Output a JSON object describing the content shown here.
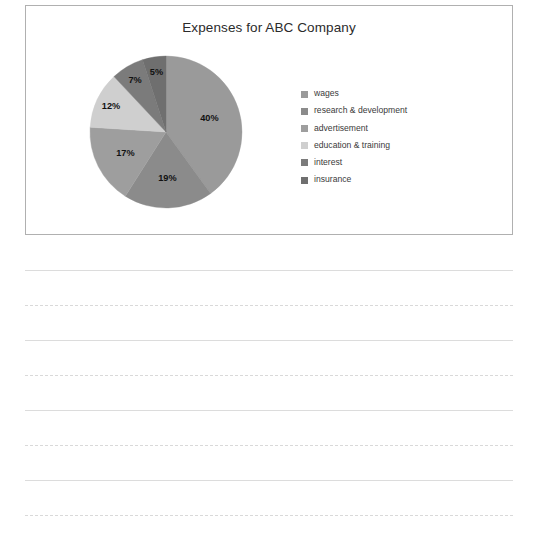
{
  "chart_panel": {
    "title": "Expenses for ABC Company",
    "border_color": "#b0b0b0",
    "background": "#ffffff"
  },
  "chart_data": {
    "type": "pie",
    "title": "Expenses for ABC Company",
    "xlabel": "",
    "ylabel": "",
    "legend_position": "right",
    "grid": false,
    "start_angle_deg": 0,
    "direction": "clockwise",
    "unit": "%",
    "categories": [
      "wages",
      "research & development",
      "advertisement",
      "education & training",
      "interest",
      "insurance"
    ],
    "values": [
      40,
      19,
      17,
      12,
      7,
      5
    ],
    "labels": [
      "40%",
      "19%",
      "17%",
      "12%",
      "7%",
      "5%"
    ],
    "colors": [
      "#9a9a9a",
      "#8b8b8b",
      "#9e9e9e",
      "#cfcfcf",
      "#7b7b7b",
      "#6f6f6f"
    ],
    "slices": [
      {
        "name": "wages",
        "value": 40,
        "label": "40%",
        "color": "#9a9a9a"
      },
      {
        "name": "research & development",
        "value": 19,
        "label": "19%",
        "color": "#8b8b8b"
      },
      {
        "name": "advertisement",
        "value": 17,
        "label": "17%",
        "color": "#9e9e9e"
      },
      {
        "name": "education & training",
        "value": 12,
        "label": "12%",
        "color": "#cfcfcf"
      },
      {
        "name": "interest",
        "value": 7,
        "label": "7%",
        "color": "#7b7b7b"
      },
      {
        "name": "insurance",
        "value": 5,
        "label": "5%",
        "color": "#6f6f6f"
      }
    ]
  },
  "legend": {
    "items": [
      {
        "label": "wages",
        "color": "#9a9a9a"
      },
      {
        "label": "research & development",
        "color": "#8b8b8b"
      },
      {
        "label": "advertisement",
        "color": "#9e9e9e"
      },
      {
        "label": "education & training",
        "color": "#cfcfcf"
      },
      {
        "label": "interest",
        "color": "#7b7b7b"
      },
      {
        "label": "insurance",
        "color": "#6f6f6f"
      }
    ]
  },
  "ruled_paper": {
    "line_color_solid": "#dcdcdc",
    "line_color_dashed": "#d9d9d9",
    "lines": [
      {
        "y": 270,
        "style": "solid"
      },
      {
        "y": 305,
        "style": "dashed"
      },
      {
        "y": 340,
        "style": "solid"
      },
      {
        "y": 375,
        "style": "dashed"
      },
      {
        "y": 410,
        "style": "solid"
      },
      {
        "y": 445,
        "style": "dashed"
      },
      {
        "y": 480,
        "style": "solid"
      },
      {
        "y": 515,
        "style": "dashed"
      }
    ]
  }
}
